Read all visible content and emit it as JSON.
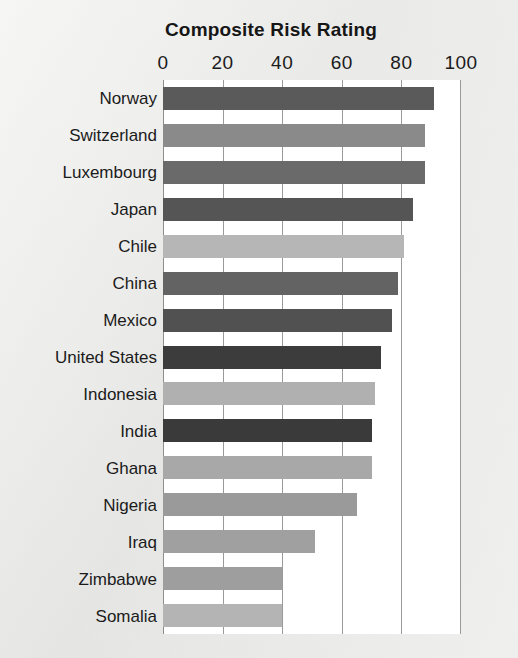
{
  "chart_data": {
    "type": "bar",
    "orientation": "horizontal",
    "title": "Composite Risk Rating",
    "xlabel": "",
    "ylabel": "",
    "xlim": [
      0,
      100
    ],
    "xticks": [
      0,
      20,
      40,
      60,
      80,
      100
    ],
    "xticklabels": [
      "0",
      "20",
      "40",
      "60",
      "80",
      "100"
    ],
    "grid": true,
    "grid_axis": "x",
    "legend": "none",
    "categories": [
      "Norway",
      "Switzerland",
      "Luxembourg",
      "Japan",
      "Chile",
      "China",
      "Mexico",
      "United States",
      "Indonesia",
      "India",
      "Ghana",
      "Nigeria",
      "Iraq",
      "Zimbabwe",
      "Somalia"
    ],
    "values": [
      91,
      88,
      88,
      84,
      81,
      79,
      77,
      73,
      71,
      70,
      70,
      65,
      51,
      40,
      40
    ],
    "bar_colors": [
      "#5a5a5a",
      "#8a8a8a",
      "#6a6a6a",
      "#555555",
      "#b6b6b6",
      "#636363",
      "#515151",
      "#3c3c3c",
      "#b0b0b0",
      "#3a3a3a",
      "#a8a8a8",
      "#9a9a9a",
      "#a0a0a0",
      "#9e9e9e",
      "#b4b4b4"
    ],
    "points": [
      {
        "category": "Norway",
        "value": 91,
        "color": "#5a5a5a"
      },
      {
        "category": "Switzerland",
        "value": 88,
        "color": "#8a8a8a"
      },
      {
        "category": "Luxembourg",
        "value": 88,
        "color": "#6a6a6a"
      },
      {
        "category": "Japan",
        "value": 84,
        "color": "#555555"
      },
      {
        "category": "Chile",
        "value": 81,
        "color": "#b6b6b6"
      },
      {
        "category": "China",
        "value": 79,
        "color": "#636363"
      },
      {
        "category": "Mexico",
        "value": 77,
        "color": "#515151"
      },
      {
        "category": "United States",
        "value": 73,
        "color": "#3c3c3c"
      },
      {
        "category": "Indonesia",
        "value": 71,
        "color": "#b0b0b0"
      },
      {
        "category": "India",
        "value": 70,
        "color": "#3a3a3a"
      },
      {
        "category": "Ghana",
        "value": 70,
        "color": "#a8a8a8"
      },
      {
        "category": "Nigeria",
        "value": 65,
        "color": "#9a9a9a"
      },
      {
        "category": "Iraq",
        "value": 51,
        "color": "#a0a0a0"
      },
      {
        "category": "Zimbabwe",
        "value": 40,
        "color": "#9e9e9e"
      },
      {
        "category": "Somalia",
        "value": 40,
        "color": "#b4b4b4"
      }
    ]
  },
  "style": {
    "page_background": "#e8e8e6",
    "plot_background": "#ffffff",
    "gridline_color": "#9a9a9a",
    "frame_color": "#8e8e8e",
    "text_color": "#1b1b1b"
  }
}
